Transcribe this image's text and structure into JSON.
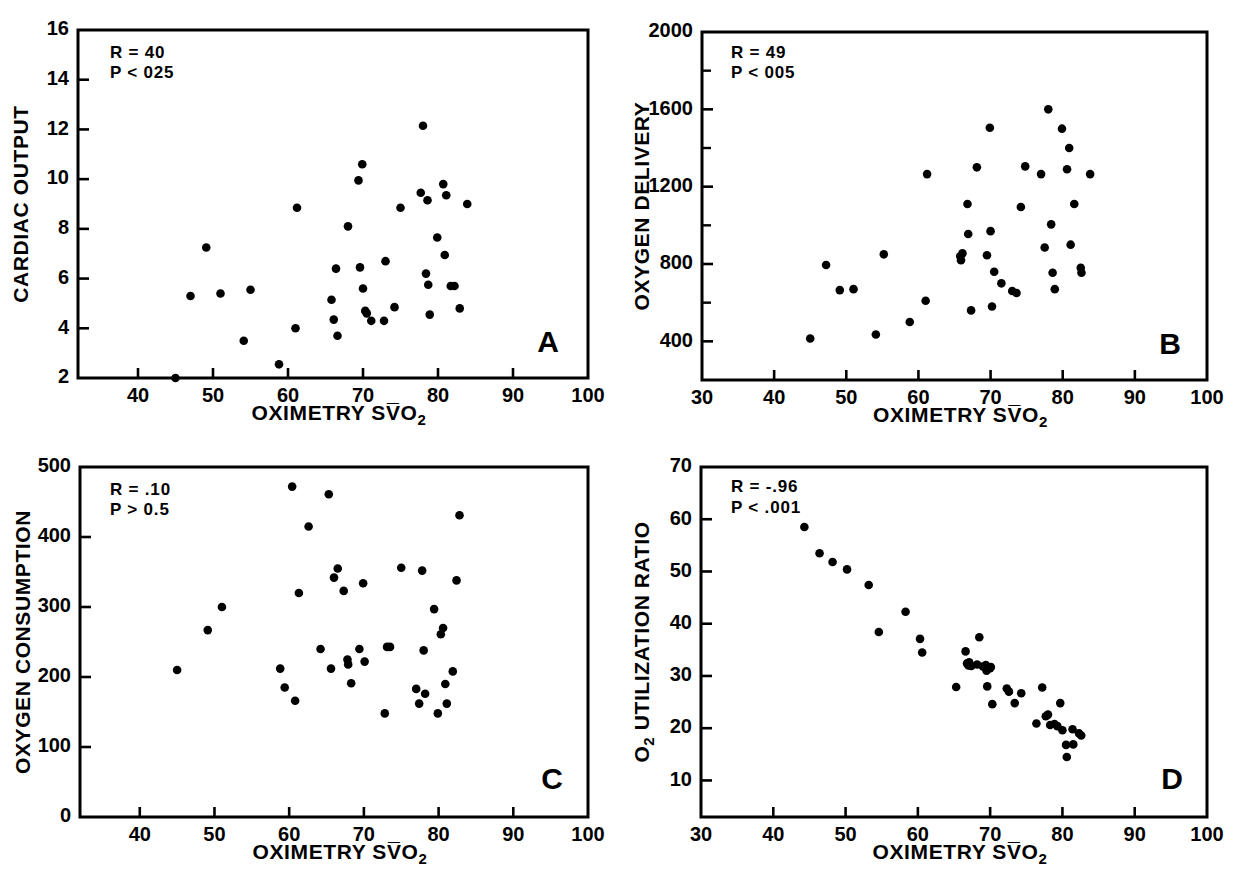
{
  "figure": {
    "background": "#ffffff",
    "ink_color": "#000000",
    "panel_count": 4
  },
  "chart_data": [
    {
      "id": "A",
      "type": "scatter",
      "panel_letter": "A",
      "title": "",
      "xlabel": "OXIMETRY SV̅O₂",
      "ylabel": "CARDIAC OUTPUT",
      "xlim": [
        32,
        100
      ],
      "ylim": [
        2,
        16
      ],
      "xticks": [
        40,
        50,
        60,
        70,
        80,
        90,
        100
      ],
      "yticks": [
        2,
        4,
        6,
        8,
        10,
        12,
        14,
        16
      ],
      "xtick_labels": [
        "40",
        "50",
        "60",
        "70",
        "80",
        "90",
        "100"
      ],
      "ytick_labels": [
        "2",
        "4",
        "6",
        "8",
        "10",
        "12",
        "14",
        "16"
      ],
      "grid": false,
      "legend": null,
      "annotations": [
        "R = 40",
        "P < 025"
      ],
      "annotation_r": "R = 40",
      "annotation_p": "P < 025",
      "points": [
        [
          45.0,
          2.0
        ],
        [
          47.0,
          5.3
        ],
        [
          49.1,
          7.25
        ],
        [
          51.0,
          5.4
        ],
        [
          54.1,
          3.5
        ],
        [
          55.0,
          5.55
        ],
        [
          58.8,
          2.55
        ],
        [
          61.0,
          4.0
        ],
        [
          61.2,
          8.85
        ],
        [
          65.8,
          5.15
        ],
        [
          66.1,
          4.35
        ],
        [
          66.4,
          6.4
        ],
        [
          66.6,
          3.7
        ],
        [
          68.0,
          8.1
        ],
        [
          69.4,
          9.95
        ],
        [
          69.6,
          6.45
        ],
        [
          69.9,
          10.6
        ],
        [
          70.0,
          5.6
        ],
        [
          70.3,
          4.7
        ],
        [
          70.5,
          4.6
        ],
        [
          71.1,
          4.3
        ],
        [
          72.8,
          4.3
        ],
        [
          73.0,
          6.7
        ],
        [
          74.2,
          4.85
        ],
        [
          75.0,
          8.85
        ],
        [
          77.7,
          9.45
        ],
        [
          78.0,
          12.15
        ],
        [
          78.4,
          6.2
        ],
        [
          78.6,
          9.15
        ],
        [
          78.7,
          5.75
        ],
        [
          78.9,
          4.55
        ],
        [
          79.9,
          7.65
        ],
        [
          80.7,
          9.8
        ],
        [
          80.9,
          6.95
        ],
        [
          81.1,
          9.35
        ],
        [
          81.7,
          5.7
        ],
        [
          82.2,
          5.7
        ],
        [
          82.9,
          4.8
        ],
        [
          83.9,
          9.0
        ]
      ]
    },
    {
      "id": "B",
      "type": "scatter",
      "panel_letter": "B",
      "title": "",
      "xlabel": "OXIMETRY SV̅O₂",
      "ylabel": "OXYGEN DELIVERY",
      "xlim": [
        30,
        100
      ],
      "ylim": [
        200,
        2000
      ],
      "xticks": [
        30,
        40,
        50,
        60,
        70,
        80,
        90,
        100
      ],
      "yticks": [
        400,
        800,
        1200,
        1600,
        2000
      ],
      "yticks_minor": [
        600,
        1000,
        1400,
        1800
      ],
      "xtick_labels": [
        "30",
        "40",
        "50",
        "60",
        "70",
        "80",
        "90",
        "100"
      ],
      "ytick_labels": [
        "400",
        "800",
        "1200",
        "1600",
        "2000"
      ],
      "grid": false,
      "legend": null,
      "annotations": [
        "R = 49",
        "P < 005"
      ],
      "annotation_r": "R = 49",
      "annotation_p": "P < 005",
      "points": [
        [
          45.0,
          415
        ],
        [
          47.2,
          795
        ],
        [
          49.1,
          665
        ],
        [
          51.0,
          670
        ],
        [
          54.1,
          435
        ],
        [
          55.2,
          850
        ],
        [
          58.8,
          500
        ],
        [
          61.0,
          610
        ],
        [
          61.2,
          1265
        ],
        [
          65.8,
          840
        ],
        [
          65.9,
          820
        ],
        [
          66.1,
          855
        ],
        [
          66.8,
          1110
        ],
        [
          66.9,
          955
        ],
        [
          67.3,
          560
        ],
        [
          68.1,
          1300
        ],
        [
          69.5,
          845
        ],
        [
          69.9,
          1505
        ],
        [
          70.0,
          970
        ],
        [
          70.2,
          580
        ],
        [
          70.5,
          760
        ],
        [
          71.5,
          700
        ],
        [
          73.0,
          660
        ],
        [
          73.6,
          650
        ],
        [
          74.2,
          1095
        ],
        [
          74.8,
          1305
        ],
        [
          77.0,
          1265
        ],
        [
          77.5,
          885
        ],
        [
          78.0,
          1600
        ],
        [
          78.4,
          1005
        ],
        [
          78.6,
          755
        ],
        [
          78.9,
          670
        ],
        [
          79.9,
          1500
        ],
        [
          80.6,
          1290
        ],
        [
          80.9,
          1400
        ],
        [
          81.1,
          900
        ],
        [
          81.6,
          1110
        ],
        [
          82.5,
          780
        ],
        [
          82.6,
          755
        ],
        [
          83.8,
          1265
        ]
      ]
    },
    {
      "id": "C",
      "type": "scatter",
      "panel_letter": "C",
      "title": "",
      "xlabel": "OXIMETRY SV̅O₂",
      "ylabel": "OXYGEN CONSUMPTION",
      "xlim": [
        32,
        100
      ],
      "ylim": [
        0,
        500
      ],
      "xticks": [
        40,
        50,
        60,
        70,
        80,
        90,
        100
      ],
      "yticks": [
        0,
        100,
        200,
        300,
        400,
        500
      ],
      "xtick_labels": [
        "40",
        "50",
        "60",
        "70",
        "80",
        "90",
        "100"
      ],
      "ytick_labels": [
        "0",
        "100",
        "200",
        "300",
        "400",
        "500"
      ],
      "grid": false,
      "legend": null,
      "annotations": [
        "R = .10",
        "P > 0.5"
      ],
      "annotation_r": "R = .10",
      "annotation_p": "P > 0.5",
      "points": [
        [
          45.0,
          210
        ],
        [
          49.1,
          267
        ],
        [
          51.0,
          300
        ],
        [
          58.8,
          212
        ],
        [
          59.4,
          185
        ],
        [
          60.4,
          472
        ],
        [
          60.8,
          166
        ],
        [
          61.3,
          320
        ],
        [
          62.6,
          415
        ],
        [
          64.2,
          240
        ],
        [
          65.3,
          461
        ],
        [
          65.6,
          212
        ],
        [
          66.0,
          342
        ],
        [
          66.5,
          355
        ],
        [
          67.3,
          323
        ],
        [
          67.8,
          225
        ],
        [
          67.9,
          218
        ],
        [
          68.3,
          191
        ],
        [
          69.4,
          240
        ],
        [
          69.9,
          334
        ],
        [
          70.1,
          222
        ],
        [
          72.8,
          148
        ],
        [
          73.1,
          243
        ],
        [
          73.5,
          243
        ],
        [
          75.0,
          356
        ],
        [
          77.0,
          183
        ],
        [
          77.4,
          162
        ],
        [
          77.8,
          352
        ],
        [
          78.0,
          238
        ],
        [
          78.2,
          176
        ],
        [
          79.4,
          297
        ],
        [
          79.9,
          148
        ],
        [
          80.3,
          261
        ],
        [
          80.6,
          270
        ],
        [
          80.9,
          190
        ],
        [
          81.1,
          162
        ],
        [
          81.9,
          208
        ],
        [
          82.4,
          338
        ],
        [
          82.8,
          431
        ]
      ]
    },
    {
      "id": "D",
      "type": "scatter",
      "panel_letter": "D",
      "title": "",
      "xlabel": "OXIMETRY SV̅O₂",
      "ylabel": "O₂ UTILIZATION RATIO",
      "ylabel_prefix": "O",
      "ylabel_sub": "2",
      "ylabel_rest": " UTILIZATION RATIO",
      "xlim": [
        30,
        100
      ],
      "ylim": [
        3,
        70
      ],
      "xticks": [
        30,
        40,
        50,
        60,
        70,
        80,
        90,
        100
      ],
      "yticks": [
        10,
        20,
        30,
        40,
        50,
        60,
        70
      ],
      "xtick_labels": [
        "30",
        "40",
        "50",
        "60",
        "70",
        "80",
        "90",
        "100"
      ],
      "ytick_labels": [
        "10",
        "20",
        "30",
        "40",
        "50",
        "60",
        "70"
      ],
      "grid": false,
      "legend": null,
      "annotations": [
        "R = -.96",
        "P < .001"
      ],
      "annotation_r": "R = -.96",
      "annotation_p": "P < .001",
      "points": [
        [
          44.3,
          58.5
        ],
        [
          46.4,
          53.5
        ],
        [
          48.2,
          51.8
        ],
        [
          50.2,
          50.4
        ],
        [
          53.2,
          47.4
        ],
        [
          54.6,
          38.4
        ],
        [
          58.3,
          42.3
        ],
        [
          60.3,
          37.1
        ],
        [
          60.6,
          34.5
        ],
        [
          65.3,
          27.9
        ],
        [
          66.6,
          34.7
        ],
        [
          66.8,
          32.4
        ],
        [
          67.0,
          32.0
        ],
        [
          67.1,
          32.6
        ],
        [
          67.4,
          31.9
        ],
        [
          68.2,
          32.2
        ],
        [
          68.5,
          37.4
        ],
        [
          69.0,
          31.8
        ],
        [
          69.4,
          32.1
        ],
        [
          69.5,
          31.0
        ],
        [
          69.6,
          28.0
        ],
        [
          70.0,
          31.5
        ],
        [
          70.1,
          31.7
        ],
        [
          70.3,
          24.6
        ],
        [
          72.3,
          27.6
        ],
        [
          72.6,
          27.0
        ],
        [
          73.4,
          24.8
        ],
        [
          74.3,
          26.7
        ],
        [
          76.4,
          20.9
        ],
        [
          77.2,
          27.8
        ],
        [
          77.7,
          22.3
        ],
        [
          78.0,
          22.6
        ],
        [
          78.3,
          20.6
        ],
        [
          78.9,
          20.8
        ],
        [
          79.3,
          20.4
        ],
        [
          79.7,
          24.8
        ],
        [
          80.0,
          19.6
        ],
        [
          80.5,
          16.8
        ],
        [
          80.6,
          14.5
        ],
        [
          81.4,
          19.8
        ],
        [
          81.5,
          16.9
        ],
        [
          82.3,
          19.0
        ],
        [
          82.6,
          18.6
        ]
      ]
    }
  ]
}
